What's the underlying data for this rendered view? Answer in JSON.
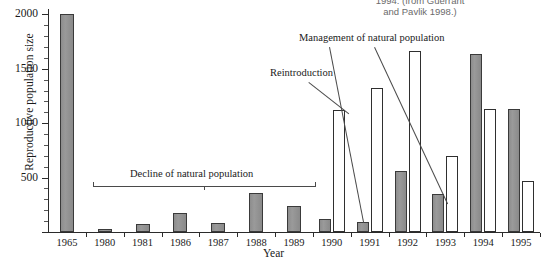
{
  "caption": "1994. (from Guerrant\nand Pavlik 1998.)",
  "chart_data": {
    "type": "bar",
    "title": "",
    "xlabel": "Year",
    "ylabel": "Reproductive population size",
    "ylim": [
      0,
      2050
    ],
    "yticks": [
      0,
      500,
      1000,
      1500,
      2000
    ],
    "ytick_labels": [
      "",
      "500",
      "1000",
      "1500",
      "2000"
    ],
    "minor_tick_step": 100,
    "grid": false,
    "legend": "none",
    "categories": [
      "1965",
      "1980",
      "1981",
      "1986",
      "1987",
      "1988",
      "1989",
      "1990",
      "1991",
      "1992",
      "1993",
      "1994",
      "1995"
    ],
    "series": [
      {
        "name": "Natural population",
        "style": "solid-gray",
        "color": "#919191",
        "values": [
          2000,
          25,
          70,
          175,
          80,
          360,
          235,
          115,
          95,
          560,
          345,
          1640,
          1130
        ]
      },
      {
        "name": "Reintroduced population",
        "style": "open-white",
        "color": "#ffffff",
        "values": [
          null,
          null,
          null,
          null,
          null,
          null,
          null,
          1120,
          1320,
          1660,
          700,
          1130,
          470
        ]
      }
    ],
    "annotations": [
      {
        "name": "decline-bracket",
        "text": "Decline of natural population",
        "type": "bracket",
        "spans": [
          "1980",
          "1989"
        ]
      },
      {
        "name": "reintroduction",
        "text": "Reintroduction",
        "type": "leader",
        "points_to": "1990 open bar"
      },
      {
        "name": "management",
        "text": "Management of natural population",
        "type": "leader",
        "points_to": "1991 and 1993 solid bars"
      }
    ]
  }
}
